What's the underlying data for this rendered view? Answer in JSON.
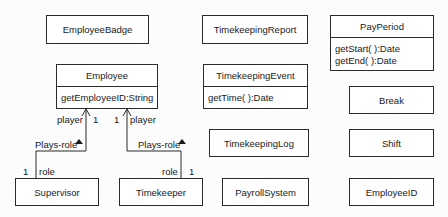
{
  "diagram": {
    "type": "UML class diagram",
    "classes": {
      "employee_badge": {
        "name": "EmployeeBadge"
      },
      "timekeeping_report": {
        "name": "TimekeepingReport"
      },
      "pay_period": {
        "name": "PayPeriod",
        "methods": [
          "getStart( ):Date",
          "getEnd( ):Date"
        ]
      },
      "employee": {
        "name": "Employee",
        "methods": [
          "getEmployeeID:String"
        ]
      },
      "timekeeping_event": {
        "name": "TimekeepingEvent",
        "methods": [
          "getTime( ):Date"
        ]
      },
      "break": {
        "name": "Break"
      },
      "timekeeping_log": {
        "name": "TimekeepingLog"
      },
      "shift": {
        "name": "Shift"
      },
      "supervisor": {
        "name": "Supervisor"
      },
      "timekeeper": {
        "name": "Timekeeper"
      },
      "payroll_system": {
        "name": "PayrollSystem"
      },
      "employee_id": {
        "name": "EmployeeID"
      }
    },
    "associations": [
      {
        "from": "Supervisor",
        "to": "Employee",
        "name": "Plays-role",
        "from_role": "role",
        "from_multiplicity": "1",
        "to_role": "player",
        "to_multiplicity": "1"
      },
      {
        "from": "Timekeeper",
        "to": "Employee",
        "name": "Plays-role",
        "from_role": "role",
        "from_multiplicity": "1",
        "to_role": "player",
        "to_multiplicity": "1"
      }
    ]
  }
}
